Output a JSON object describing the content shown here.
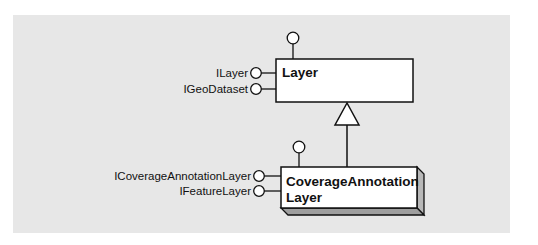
{
  "diagram": {
    "type": "uml-class-inheritance",
    "colors": {
      "panel_background": "#e7e7e7",
      "box_fill": "#ffffff",
      "stroke": "#111111",
      "shadow_face": "#b8b8b8"
    },
    "classes": [
      {
        "id": "layer",
        "name_lines": [
          "Layer"
        ],
        "kind": "abstract",
        "interfaces": [
          "ILayer",
          "IGeoDataset"
        ],
        "has_top_lollipop": true
      },
      {
        "id": "coverage-annotation-layer",
        "name_lines": [
          "CoverageAnnotation",
          "Layer"
        ],
        "kind": "creatable",
        "interfaces": [
          "ICoverageAnnotationLayer",
          "IFeatureLayer"
        ],
        "has_top_lollipop": true
      }
    ],
    "relationships": [
      {
        "type": "inheritance",
        "from": "coverage-annotation-layer",
        "to": "layer"
      }
    ]
  }
}
